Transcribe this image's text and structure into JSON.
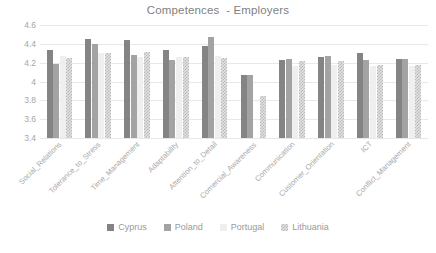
{
  "chart_data": {
    "type": "bar",
    "title": "Competences  - Employers",
    "xlabel": "",
    "ylabel": "",
    "ylim": [
      3.4,
      4.6
    ],
    "yticks": [
      "4.6",
      "4.4",
      "4.2",
      "4",
      "3.8",
      "3.6",
      "3.4"
    ],
    "ytick_values": [
      4.6,
      4.4,
      4.2,
      4.0,
      3.8,
      3.6,
      3.4
    ],
    "grid": true,
    "legend_position": "bottom",
    "categories": [
      "Social_Relations",
      "Tolerance_to_Stress",
      "Time_Management",
      "Adaptability",
      "Attention_to_Detail",
      "Comercial_Awareness",
      "Communication",
      "Customer_Orientation",
      "ICT",
      "Conflict_Management"
    ],
    "series": [
      {
        "name": "Cyprus",
        "color": "#848484",
        "values": [
          4.33,
          4.45,
          4.44,
          4.33,
          4.38,
          4.07,
          4.23,
          4.26,
          4.3,
          4.24
        ]
      },
      {
        "name": "Poland",
        "color": "#a3a3a3",
        "values": [
          4.19,
          4.4,
          4.28,
          4.23,
          4.47,
          4.07,
          4.24,
          4.27,
          4.23,
          4.24
        ]
      },
      {
        "name": "Portugal",
        "color": "#efefef",
        "values": [
          4.27,
          4.3,
          4.26,
          4.26,
          4.27,
          3.4,
          4.17,
          4.18,
          4.16,
          4.16
        ]
      },
      {
        "name": "Lithuania",
        "color": "#d9d9d9",
        "values": [
          4.25,
          4.3,
          4.31,
          4.26,
          4.25,
          3.85,
          4.22,
          4.22,
          4.18,
          4.18
        ]
      }
    ]
  },
  "legend": {
    "items": [
      {
        "label": "Cyprus"
      },
      {
        "label": "Poland"
      },
      {
        "label": "Portugal"
      },
      {
        "label": "Lithuania"
      }
    ]
  }
}
